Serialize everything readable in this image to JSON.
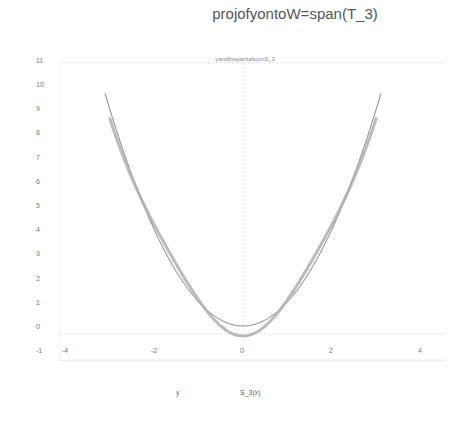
{
  "title": "projofyontoW=span(T_3)",
  "subtitle": "yandtheparitalsumS_3",
  "legend": {
    "items": [
      {
        "label": "y"
      },
      {
        "label": "S_3(x)"
      }
    ]
  },
  "chart_data": {
    "type": "line",
    "title": "projofyontoW=span(T_3)",
    "subtitle": "yandtheparitalsumS_3",
    "xlabel": "",
    "ylabel": "",
    "xlim": [
      -4.5,
      4.5
    ],
    "ylim": [
      -1,
      11
    ],
    "x_ticks": [
      -4,
      -2,
      0,
      2,
      4
    ],
    "y_ticks": [
      -1,
      0,
      1,
      2,
      3,
      4,
      5,
      6,
      7,
      8,
      9,
      10,
      11
    ],
    "grid": false,
    "legend_position": "bottom",
    "series": [
      {
        "name": "y",
        "x": [
          -3.1,
          -2,
          -1,
          0,
          1,
          2,
          3.1
        ],
        "values": [
          9.6,
          4.0,
          1.0,
          0.0,
          1.0,
          4.0,
          9.6
        ]
      },
      {
        "name": "S_3(x)",
        "x": [
          -3,
          -2,
          -1,
          0,
          1,
          2,
          3
        ],
        "values": [
          8.3,
          4.1,
          1.2,
          -0.4,
          1.2,
          4.1,
          8.3
        ]
      }
    ]
  }
}
